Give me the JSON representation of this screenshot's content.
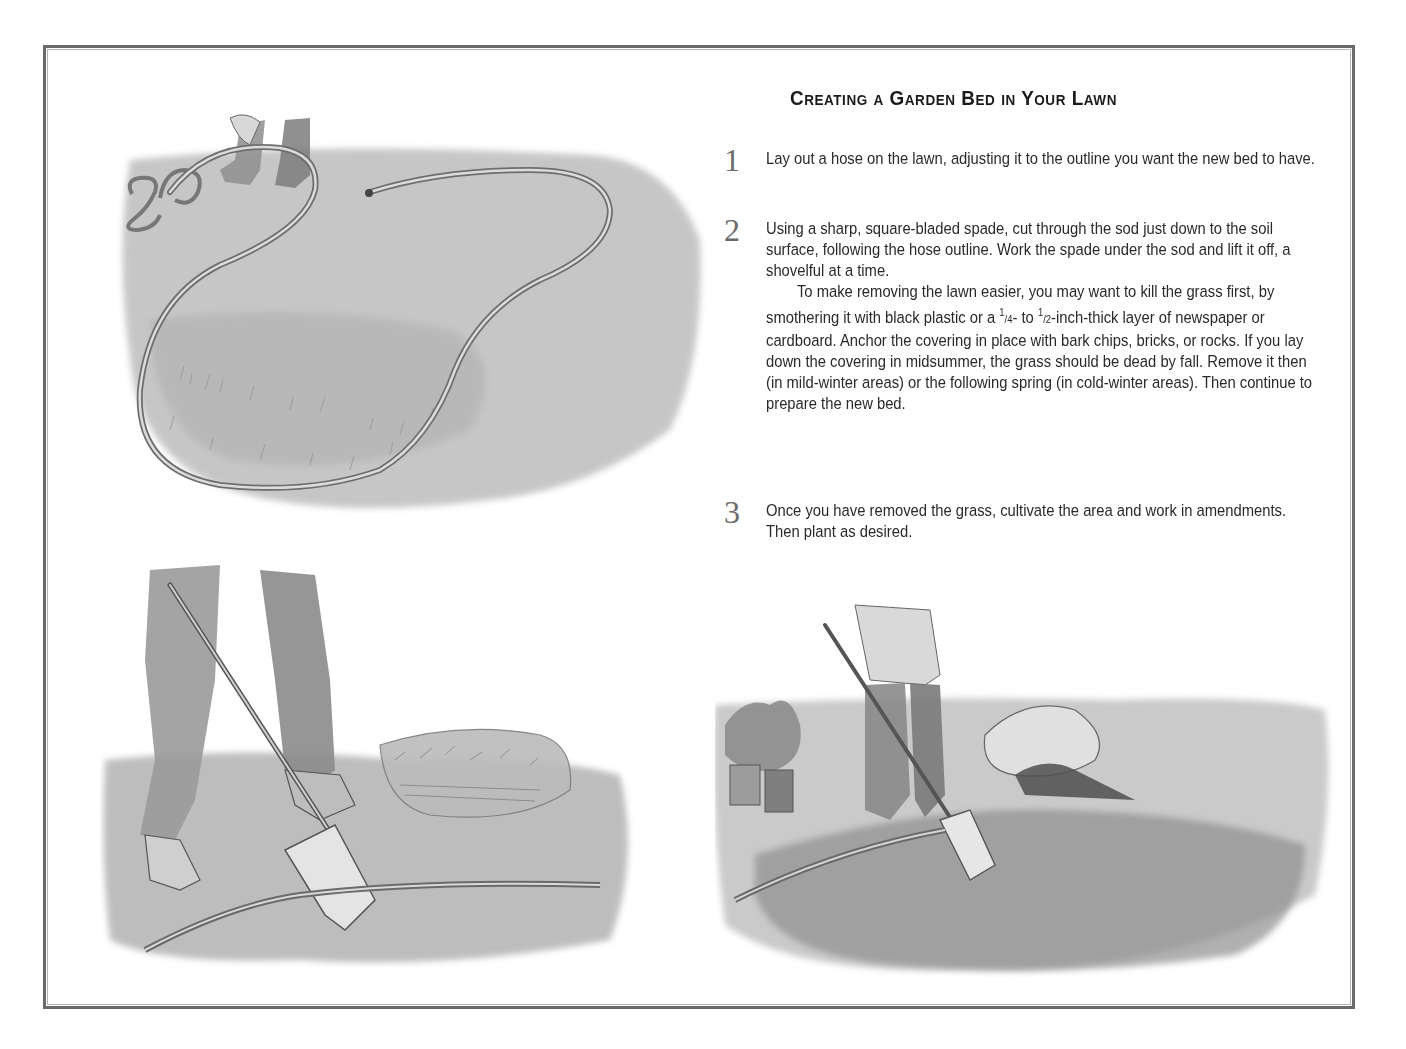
{
  "page": {
    "title": "Creating a Garden Bed in Your Lawn",
    "border_color": "#6a6a6a",
    "numeral_color": "#6b6b6b",
    "text_color": "#2a2a2a"
  },
  "steps": [
    {
      "number": "1",
      "paragraphs": [
        "Lay out a hose on the lawn, adjusting it to the outline you want the new bed to have."
      ]
    },
    {
      "number": "2",
      "paragraphs": [
        "Using a sharp, square-bladed spade, cut through the sod just down to the soil surface, following the hose outline. Work the spade under the sod and lift it off, a shovelful at a time.",
        "To make removing the lawn easier, you may want to kill the grass first, by smothering it with black plastic or a ¼- to ½-inch-thick layer of newspaper or cardboard. Anchor the covering in place with bark chips, bricks, or rocks. If you lay down the covering in midsummer, the grass should be dead by fall. Remove it then (in mild-winter areas) or the following spring (in cold-winter areas). Then continue to prepare the new bed."
      ],
      "paragraph2_parts": {
        "before_frac": "To make removing the lawn easier, you may want to kill the grass first, by smothering it with black plastic or a ",
        "frac1_num": "1",
        "frac1_den": "/4",
        "between": "- to ",
        "frac2_num": "1",
        "frac2_den": "/2",
        "after_frac": "-inch-thick layer of newspaper or cardboard. Anchor the covering in place with bark chips, bricks, or rocks. If you lay down the covering in midsummer, the grass should be dead by fall. Remove it then (in mild-winter areas) or the following spring (in cold-winter areas). Then continue to prepare the new bed."
      }
    },
    {
      "number": "3",
      "paragraphs": [
        "Once you have removed the grass, cultivate the area and work in amendments. Then plant as desired."
      ]
    }
  ],
  "illustrations": [
    {
      "id": "hose-outline",
      "description": "Person laying out a garden hose in a curved outline on the lawn"
    },
    {
      "id": "cutting-sod",
      "description": "Person pushing a spade into the sod along the hose line, lifted sod stacked behind"
    },
    {
      "id": "cultivating-bed",
      "description": "Person working the soil with a spade, potted plants and bag of amendment in background"
    }
  ]
}
